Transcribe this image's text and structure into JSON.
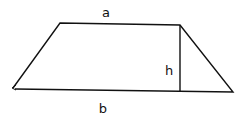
{
  "diagram": {
    "type": "trapezoid",
    "labels": {
      "top_side": "a",
      "bottom_side": "b",
      "height": "h"
    },
    "stroke_color": "#111111",
    "background_color": "#ffffff"
  }
}
